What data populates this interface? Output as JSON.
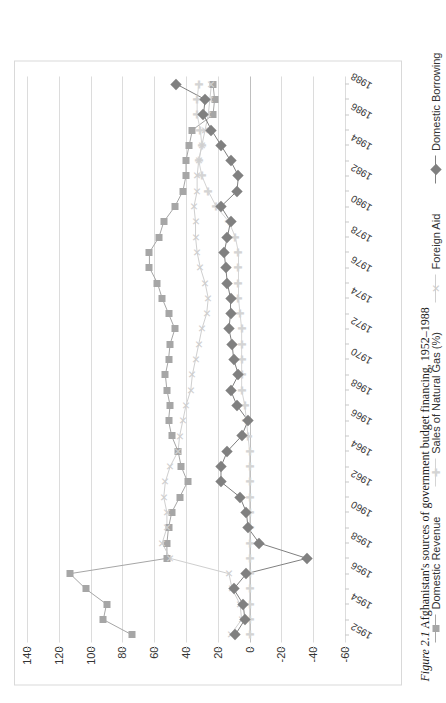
{
  "caption": {
    "number": "Figure 2.1",
    "text": "Afghanistan's sources of government budget financing, 1952–1988"
  },
  "chart_data": {
    "type": "line",
    "title": "",
    "subtitle": "",
    "xlabel": "",
    "ylabel": "",
    "ylim": [
      -60,
      140
    ],
    "yticks": [
      140,
      120,
      100,
      80,
      60,
      40,
      20,
      0,
      -20,
      -40,
      -60
    ],
    "ytick_labels": [
      "140",
      "120",
      "100",
      "80",
      "60",
      "40",
      "20",
      "0",
      "-20",
      "-40",
      "-60"
    ],
    "grid": true,
    "legend_position": "bottom",
    "orientation": "rotated-90",
    "categories": [
      "1952",
      "1953",
      "1954",
      "1955",
      "1956",
      "1957",
      "1958",
      "1959",
      "1960",
      "1961",
      "1962",
      "1963",
      "1964",
      "1965",
      "1966",
      "1967",
      "1968",
      "1969",
      "1970",
      "1971",
      "1972",
      "1973",
      "1974",
      "1975",
      "1976",
      "1977",
      "1978",
      "1979",
      "1980",
      "1981",
      "1982",
      "1983",
      "1984",
      "1985",
      "1986",
      "1987",
      "1988"
    ],
    "tick_labels": [
      "1952",
      "",
      "1954",
      "",
      "1956",
      "",
      "1958",
      "",
      "1960",
      "",
      "1962",
      "",
      "1964",
      "",
      "1966",
      "",
      "1968",
      "",
      "1970",
      "",
      "1972",
      "",
      "1974",
      "",
      "1976",
      "",
      "1978",
      "",
      "1980",
      "",
      "1982",
      "",
      "1984",
      "",
      "1986",
      "",
      "1988"
    ],
    "series": [
      {
        "name": "Domestic Revenue",
        "marker": "square",
        "color": "#a6a6a6",
        "values": [
          74,
          92,
          90,
          103,
          113,
          52,
          52,
          51,
          49,
          44,
          39,
          43,
          45,
          49,
          51,
          50,
          52,
          53,
          51,
          50,
          47,
          51,
          55,
          58,
          63,
          63,
          57,
          54,
          47,
          42,
          40,
          40,
          38,
          36,
          23,
          22,
          23
        ]
      },
      {
        "name": "Sales of Natural Gas (%)",
        "marker": "cross",
        "color": "#d4d4d4",
        "values": [
          0,
          0,
          0,
          0,
          0,
          0,
          0,
          0,
          0,
          0,
          0,
          0,
          0,
          1,
          2,
          3,
          5,
          5,
          5,
          5,
          5,
          6,
          7,
          7,
          7,
          7,
          9,
          13,
          21,
          26,
          30,
          32,
          30,
          31,
          33,
          33,
          32
        ]
      },
      {
        "name": "Foreign Aid",
        "marker": "ex",
        "color": "#cfcfcf",
        "values": [
          12,
          5,
          6,
          11,
          13,
          50,
          55,
          52,
          52,
          54,
          53,
          50,
          45,
          44,
          42,
          40,
          37,
          36,
          34,
          32,
          30,
          27,
          26,
          28,
          31,
          33,
          34,
          34,
          35,
          33,
          33,
          32,
          30,
          28,
          26,
          25,
          24
        ]
      },
      {
        "name": "Domestic Borrowing",
        "marker": "diamond",
        "color": "#808080",
        "values": [
          9,
          3,
          4,
          10,
          2,
          -36,
          -6,
          1,
          2,
          6,
          18,
          18,
          14,
          5,
          1,
          8,
          12,
          7,
          10,
          11,
          13,
          12,
          12,
          14,
          15,
          16,
          14,
          12,
          18,
          8,
          7,
          12,
          18,
          24,
          29,
          28,
          46
        ]
      }
    ]
  },
  "legend": {
    "items": [
      {
        "label": "Domestic Revenue",
        "marker": "square",
        "color": "#a6a6a6"
      },
      {
        "label": "Sales of Natural Gas (%)",
        "marker": "cross",
        "color": "#d4d4d4"
      },
      {
        "label": "Foreign Aid",
        "marker": "ex",
        "color": "#cfcfcf"
      },
      {
        "label": "Domestic Borrowing",
        "marker": "diamond",
        "color": "#808080"
      }
    ]
  },
  "colors": {
    "frame": "#d9d9d9",
    "gridline": "#dcdcdc",
    "text": "#333333",
    "caption_text": "#1a1a1a"
  }
}
